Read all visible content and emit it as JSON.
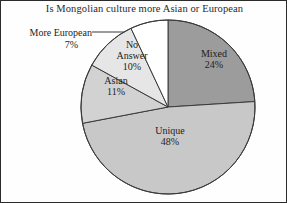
{
  "chart_data": {
    "type": "pie",
    "title": "Is Mongolian culture more Asian or European",
    "xlabel": "",
    "ylabel": "",
    "legend": "none",
    "grid": false,
    "categories": [
      "Mixed",
      "Unique",
      "Asian",
      "No Answer",
      "More European"
    ],
    "values": [
      24,
      11,
      48,
      10,
      7
    ],
    "units": "percent",
    "slices": [
      {
        "label": "Mixed",
        "value": 24,
        "value_text": "24%",
        "color": "#9c9c9c",
        "label_placement": "inside"
      },
      {
        "label": "Unique",
        "value": 48,
        "value_text": "48%",
        "color": "#c8c8c8",
        "label_placement": "inside"
      },
      {
        "label": "Asian",
        "value": 11,
        "value_text": "11%",
        "color": "#d2d2d2",
        "label_placement": "inside"
      },
      {
        "label": "No Answer",
        "value": 10,
        "value_text": "10%",
        "color": "#e6e6e6",
        "label_placement": "inside"
      },
      {
        "label": "More European",
        "value": 7,
        "value_text": "7%",
        "color": "#ffffff",
        "label_placement": "outside-leader-line"
      }
    ]
  },
  "chart": {
    "title": "Is Mongolian culture more Asian or European",
    "labels": {
      "mixed": {
        "name": "Mixed",
        "pct": "24%"
      },
      "unique": {
        "name": "Unique",
        "pct": "48%"
      },
      "asian": {
        "name": "Asian",
        "pct": "11%"
      },
      "no_answer": {
        "name": "No",
        "name2": "Answer",
        "pct": "10%"
      },
      "more_european": {
        "name": "More European",
        "pct": "7%"
      }
    }
  },
  "style": {
    "slice_mixed_color": "#9c9c9c",
    "slice_unique_color": "#c8c8c8",
    "slice_asian_color": "#d2d2d2",
    "slice_noanswer_color": "#e6e6e6",
    "slice_moreeuropean_color": "#ffffff",
    "outline_color": "#404040",
    "text_color": "#1d1d1d",
    "background_color": "#fefefe",
    "border_color": "#2b2b2b"
  }
}
